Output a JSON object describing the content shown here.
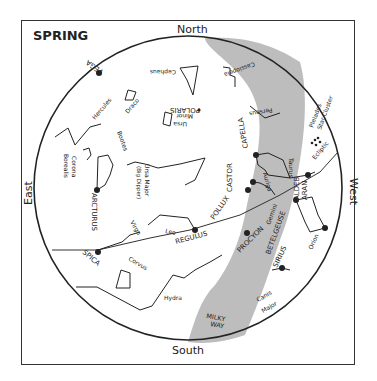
{
  "title": "SPRING",
  "directions": {
    "north": "North",
    "south": "South",
    "east": "East",
    "west": "West"
  },
  "bands": {
    "milky_way": [
      "MILKY",
      "WAY"
    ],
    "ecliptic": "Ecliptic",
    "star_cluster": "Star Cluster",
    "pleiades": "Pleiades"
  },
  "stars": {
    "vega": "VEGA",
    "polaris": "POLARIS",
    "capella": "CAPELLA",
    "castor": "CASTOR",
    "pollux": "POLLUX",
    "regulus": "REGULUS",
    "procyon": "PROCYON",
    "betelgeuse": "BETELGEUSE",
    "aldebaran_1": "ALDEB",
    "aldebaran_2": "ARAN",
    "sirius": "SIRIUS",
    "arcturus": "ARCTURUS",
    "spica": "SPICA"
  },
  "constellations": {
    "cephaus": "Cephaus",
    "cassiopeia": "Cassiopeia",
    "perseus": "Perseus",
    "hercules": "Hercules",
    "draco": "Draco",
    "ursa_minor_1": "Ursa",
    "ursa_minor_2": "Minor",
    "corona_1": "Corona",
    "corona_2": "Borealis",
    "bootes": "Bootes",
    "ursa_major_1": "Ursa Major",
    "ursa_major_2": "(Big Dipper)",
    "auriga": "Auriga",
    "taurus": "Taurus",
    "gemini": "Gemini",
    "leo": "Leo",
    "virgo": "Virgo",
    "corvus": "Corvus",
    "hydra": "Hydra",
    "orion": "Orion",
    "canis_1": "Canis",
    "canis_2": "Major"
  },
  "colors": {
    "milky_way": "#bdbdbd",
    "line": "#222222"
  }
}
